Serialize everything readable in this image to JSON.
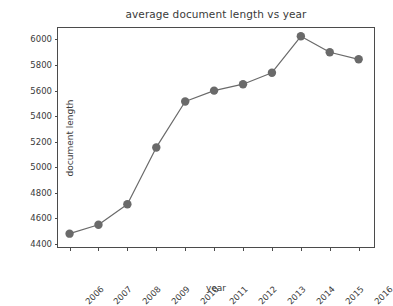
{
  "chart_data": {
    "type": "line",
    "title": "average document length vs year",
    "xlabel": "year",
    "ylabel": "document length",
    "categories": [
      "2006",
      "2007",
      "2008",
      "2009",
      "2010",
      "2011",
      "2012",
      "2013",
      "2014",
      "2015",
      "2016"
    ],
    "x": [
      2006,
      2007,
      2008,
      2009,
      2010,
      2011,
      2012,
      2013,
      2014,
      2015,
      2016
    ],
    "values": [
      4480,
      4550,
      4710,
      5155,
      5515,
      5600,
      5650,
      5740,
      6025,
      5900,
      5845
    ],
    "series": [
      {
        "name": "document length",
        "values": [
          4480,
          4550,
          4710,
          5155,
          5515,
          5600,
          5650,
          5740,
          6025,
          5900,
          5845
        ]
      }
    ],
    "ylim": [
      4360,
      6090
    ],
    "xlim": [
      2005.6,
      2016.6
    ],
    "yticks": [
      4400,
      4600,
      4800,
      5000,
      5200,
      5400,
      5600,
      5800,
      6000
    ],
    "ytick_labels": [
      "4400",
      "4600",
      "4800",
      "5000",
      "5200",
      "5400",
      "5600",
      "5800",
      "6000"
    ],
    "xtick_labels": [
      "2006",
      "2007",
      "2008",
      "2009",
      "2010",
      "2011",
      "2012",
      "2013",
      "2014",
      "2015",
      "2016"
    ],
    "xtick_rotation": -45,
    "grid": false,
    "legend": false,
    "legend_position": "none",
    "line_color": "#6a6a6a",
    "marker_color": "#6a6a6a",
    "marker": "circle",
    "marker_size": 4.2,
    "line_width": 1.2,
    "axes_color": "#4b4b4b",
    "text_color": "#3a3a3a",
    "background_color": "#ffffff"
  }
}
